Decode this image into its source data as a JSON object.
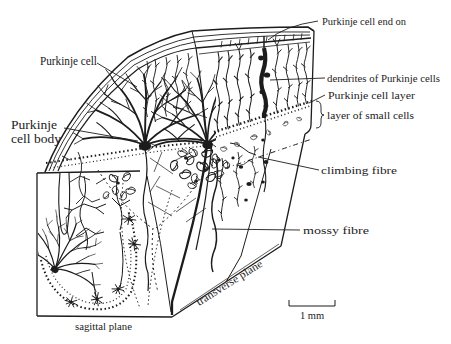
{
  "colors": {
    "ink": "#1c1c1c",
    "background": "#ffffff"
  },
  "labels": {
    "purkinje_cell": "Purkinje cell",
    "purkinje_cell_body": {
      "line1": "Purkinje",
      "line2": "cell body"
    },
    "purkinje_cell_end_on": "Purkinje cell end on",
    "dendrites_of_purkinje_cells": "dendrites of Purkinje cells",
    "purkinje_cell_layer": "Purkinje cell layer",
    "layer_of_small_cells": "layer of small cells",
    "climbing_fibre": "climbing fibre",
    "mossy_fibre": "mossy fibre"
  },
  "plane_labels": {
    "sagittal": "sagittal plane",
    "transverse": "transverse plane"
  },
  "scale_bar": {
    "label": "1 mm"
  }
}
